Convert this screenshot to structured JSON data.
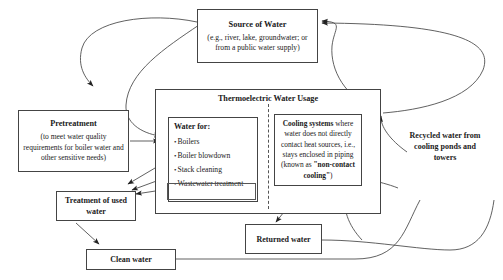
{
  "diagram": {
    "nodes": {
      "source_of_water": {
        "title": "Source of Water",
        "detail": "(e.g., river, lake, groundwater; or from a public water supply)"
      },
      "thermoelectric_usage": {
        "title": "Thermoelectric Water Usage"
      },
      "water_for": {
        "title": "Water for:",
        "items": [
          "Boilers",
          "Boiler blowdown",
          "Stack cleaning",
          "Wastewater treatment"
        ]
      },
      "cooling_systems": {
        "lead": "Cooling systems",
        "body": " where water does not directly contact heat sources, i.e., stays enclosed in piping (known as ",
        "emphasis": "\"non-contact cooling\"",
        "tail": ")"
      },
      "pretreatment": {
        "title": "Pretreatment",
        "detail": "(to meet water quality requirements for boiler water and other sensitive needs)"
      },
      "treatment_used_water": {
        "label": "Treatment of used water"
      },
      "clean_water": {
        "label": "Clean water"
      },
      "returned_water": {
        "label": "Returned water"
      },
      "recycled_water": {
        "label": "Recycled water from cooling ponds and towers"
      }
    },
    "colors": {
      "stroke": "#444444",
      "text": "#1a1a1a",
      "background": "#ffffff",
      "divider": "#555555"
    }
  }
}
